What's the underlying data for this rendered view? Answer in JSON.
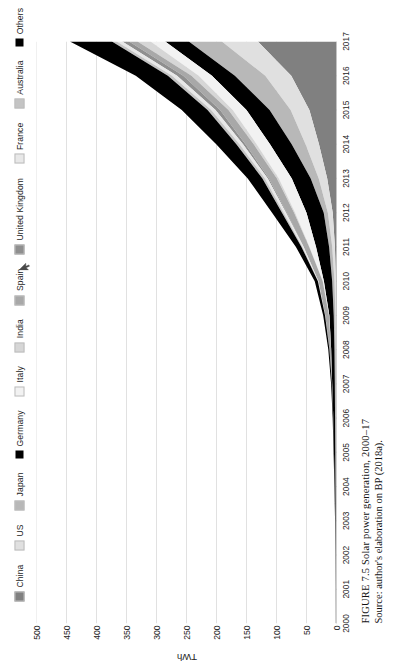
{
  "figure": {
    "caption_line1": "FIGURE 7.5   Solar power generation, 2000–17",
    "caption_line2": "Source: author's elaboration on BP (2018a)."
  },
  "legend": {
    "items": [
      {
        "label": "China",
        "color": "#808080"
      },
      {
        "label": "US",
        "color": "#e0e0e0"
      },
      {
        "label": "Japan",
        "color": "#b8b8b8"
      },
      {
        "label": "Germany",
        "color": "#000000"
      },
      {
        "label": "Italy",
        "color": "#f2f2f2"
      },
      {
        "label": "India",
        "color": "#d6d6d6"
      },
      {
        "label": "Spain",
        "color": "#a8a8a8"
      },
      {
        "label": "United Kingdom",
        "color": "#8f8f8f"
      },
      {
        "label": "France",
        "color": "#e8e8e8"
      },
      {
        "label": "Australia",
        "color": "#c4c4c4"
      },
      {
        "label": "Others",
        "color": "#000000"
      }
    ]
  },
  "axes": {
    "y_title": "TWh",
    "y_ticks": [
      "0",
      "50",
      "100",
      "150",
      "200",
      "250",
      "300",
      "350",
      "400",
      "450",
      "500"
    ],
    "x_ticks": [
      "2000",
      "2001",
      "2002",
      "2003",
      "2004",
      "2005",
      "2006",
      "2007",
      "2008",
      "2009",
      "2010",
      "2011",
      "2012",
      "2013",
      "2014",
      "2015",
      "2016",
      "2017"
    ]
  },
  "chart_data": {
    "type": "area",
    "title": "Solar power generation, 2000–17",
    "xlabel": "",
    "ylabel": "TWh",
    "ylim": [
      0,
      500
    ],
    "grid": true,
    "stacked": true,
    "legend_position": "top",
    "x": [
      2000,
      2001,
      2002,
      2003,
      2004,
      2005,
      2006,
      2007,
      2008,
      2009,
      2010,
      2011,
      2012,
      2013,
      2014,
      2015,
      2016,
      2017
    ],
    "series": [
      {
        "name": "China",
        "color": "#808080",
        "values": [
          0.0,
          0.0,
          0.0,
          0.0,
          0.0,
          0.0,
          0.1,
          0.1,
          0.2,
          0.4,
          1.0,
          2.6,
          6.3,
          15.5,
          29.2,
          45.2,
          75.4,
          131.1
        ]
      },
      {
        "name": "US",
        "color": "#e0e0e0",
        "values": [
          0.5,
          0.5,
          0.6,
          0.6,
          0.6,
          0.6,
          0.6,
          0.7,
          0.9,
          1.3,
          2.4,
          4.5,
          8.1,
          14.1,
          22.4,
          31.2,
          43.3,
          60.0
        ]
      },
      {
        "name": "Japan",
        "color": "#b8b8b8",
        "values": [
          0.4,
          0.5,
          0.6,
          0.8,
          1.1,
          1.4,
          1.7,
          2.0,
          2.3,
          2.9,
          3.8,
          5.2,
          6.9,
          13.4,
          23.1,
          35.1,
          50.7,
          55.0
        ]
      },
      {
        "name": "Germany",
        "color": "#000000",
        "values": [
          0.1,
          0.2,
          0.3,
          0.6,
          1.3,
          2.2,
          3.0,
          4.4,
          5.5,
          7.3,
          13.8,
          21.8,
          28.7,
          31.5,
          36.1,
          38.5,
          38.1,
          39.4
        ]
      },
      {
        "name": "Italy",
        "color": "#f2f2f2",
        "values": [
          0.0,
          0.0,
          0.0,
          0.0,
          0.0,
          0.0,
          0.0,
          0.0,
          0.2,
          0.7,
          1.9,
          10.8,
          18.9,
          21.6,
          22.3,
          22.9,
          22.1,
          24.4
        ]
      },
      {
        "name": "India",
        "color": "#d6d6d6",
        "values": [
          0.0,
          0.0,
          0.0,
          0.0,
          0.0,
          0.0,
          0.0,
          0.0,
          0.0,
          0.0,
          0.1,
          0.6,
          1.8,
          3.3,
          4.9,
          7.2,
          12.1,
          21.7
        ]
      },
      {
        "name": "Spain",
        "color": "#a8a8a8",
        "values": [
          0.0,
          0.0,
          0.0,
          0.0,
          0.0,
          0.0,
          0.1,
          0.5,
          2.6,
          6.1,
          7.0,
          9.1,
          12.1,
          13.2,
          13.7,
          13.9,
          13.7,
          14.0
        ]
      },
      {
        "name": "United Kingdom",
        "color": "#8f8f8f",
        "values": [
          0.0,
          0.0,
          0.0,
          0.0,
          0.0,
          0.0,
          0.0,
          0.0,
          0.0,
          0.0,
          0.0,
          0.2,
          1.3,
          2.0,
          4.1,
          7.6,
          10.4,
          11.5
        ]
      },
      {
        "name": "France",
        "color": "#e8e8e8",
        "values": [
          0.0,
          0.0,
          0.0,
          0.0,
          0.0,
          0.0,
          0.0,
          0.0,
          0.0,
          0.2,
          0.6,
          2.1,
          4.0,
          4.7,
          5.9,
          7.3,
          8.3,
          9.2
        ]
      },
      {
        "name": "Australia",
        "color": "#c4c4c4",
        "values": [
          0.0,
          0.0,
          0.0,
          0.0,
          0.0,
          0.0,
          0.0,
          0.0,
          0.1,
          0.2,
          0.4,
          1.5,
          2.8,
          4.2,
          5.2,
          6.0,
          7.0,
          8.0
        ]
      },
      {
        "name": "Others",
        "color": "#000000",
        "values": [
          0.2,
          0.2,
          0.3,
          0.4,
          0.5,
          0.7,
          0.9,
          1.3,
          1.9,
          3.1,
          5.3,
          9.2,
          16.5,
          24.5,
          33.5,
          43.0,
          53.5,
          70.0
        ]
      }
    ]
  }
}
